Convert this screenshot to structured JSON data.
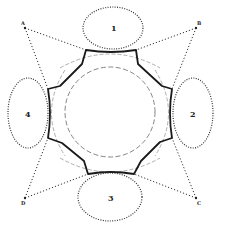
{
  "diagram": {
    "type": "geometric-layout",
    "colors": {
      "ink": "#1a1a1a",
      "dotted": "#333333",
      "dashed_light": "#888888",
      "background": "#ffffff"
    },
    "ellipses": [
      {
        "label": "1",
        "cx": 113,
        "cy": 28,
        "rx": 30,
        "ry": 21
      },
      {
        "label": "2",
        "cx": 193,
        "cy": 113,
        "rx": 20,
        "ry": 35
      },
      {
        "label": "3",
        "cx": 110,
        "cy": 197,
        "rx": 32,
        "ry": 24
      },
      {
        "label": "4",
        "cx": 28,
        "cy": 113,
        "rx": 20,
        "ry": 35
      }
    ],
    "corner_points": [
      {
        "label": "A",
        "x": 25,
        "y": 28
      },
      {
        "label": "B",
        "x": 196,
        "y": 28
      },
      {
        "label": "C",
        "x": 196,
        "y": 198
      },
      {
        "label": "D",
        "x": 25,
        "y": 198
      }
    ],
    "octagon_outline": "M86,50 Q111,54 136,50 L138,64 L162,86 L172,89 Q168,113 172,138 L160,142 L141,161 L134,174 Q111,170 88,174 L84,161 L62,143 L48,138 Q52,113 48,89 L60,86 L82,64 Z",
    "inner_circle": {
      "cx": 110,
      "cy": 112,
      "r": 45
    },
    "outer_dashed_circle": {
      "cx": 110,
      "cy": 112,
      "r": 62
    },
    "labels": {
      "e1": "1",
      "e2": "2",
      "e3": "3",
      "e4": "4",
      "pA": "A",
      "pB": "B",
      "pC": "C",
      "pD": "D"
    }
  }
}
